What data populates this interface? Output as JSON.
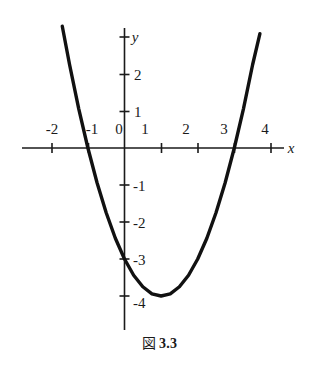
{
  "caption": {
    "label": "図",
    "number": "3.3"
  },
  "chart_data": {
    "type": "line",
    "title": "",
    "subtitle": "",
    "xlabel": "x",
    "ylabel": "y",
    "grid": false,
    "legend": false,
    "xlim": [
      -2.6,
      4.6
    ],
    "ylim": [
      -4.6,
      3.2
    ],
    "xticks": [
      -2,
      -1,
      0,
      1,
      2,
      3,
      4
    ],
    "xticklabels": [
      "-2",
      "-1",
      "0",
      "1",
      "2",
      "3",
      "4"
    ],
    "yticks": [
      -4,
      -3,
      -2,
      -1,
      1,
      2,
      3
    ],
    "yticklabels": [
      "-4",
      "-3",
      "-2",
      "-1",
      "1",
      "2",
      "3"
    ],
    "origin_label": "0",
    "series": [
      {
        "name": "parabola",
        "equation": "y = x^2 - 2x - 3",
        "vertex": [
          1,
          -4
        ],
        "roots": [
          -1,
          3
        ],
        "y_intercept": -3,
        "x": [
          -1.7,
          -1.5,
          -1.25,
          -1.0,
          -0.75,
          -0.5,
          -0.25,
          0.0,
          0.25,
          0.5,
          0.75,
          1.0,
          1.25,
          1.5,
          1.75,
          2.0,
          2.25,
          2.5,
          2.75,
          3.0,
          3.25,
          3.5,
          3.7
        ],
        "values": [
          3.29,
          2.25,
          1.06,
          0.0,
          -0.94,
          -1.75,
          -2.44,
          -3.0,
          -3.44,
          -3.75,
          -3.94,
          -4.0,
          -3.94,
          -3.75,
          -3.44,
          -3.0,
          -2.44,
          -1.75,
          -0.94,
          0.0,
          1.06,
          2.25,
          3.09
        ]
      }
    ],
    "colors": {
      "curve": "#111111",
      "axis": "#1a1a1a",
      "background": "#ffffff"
    }
  }
}
